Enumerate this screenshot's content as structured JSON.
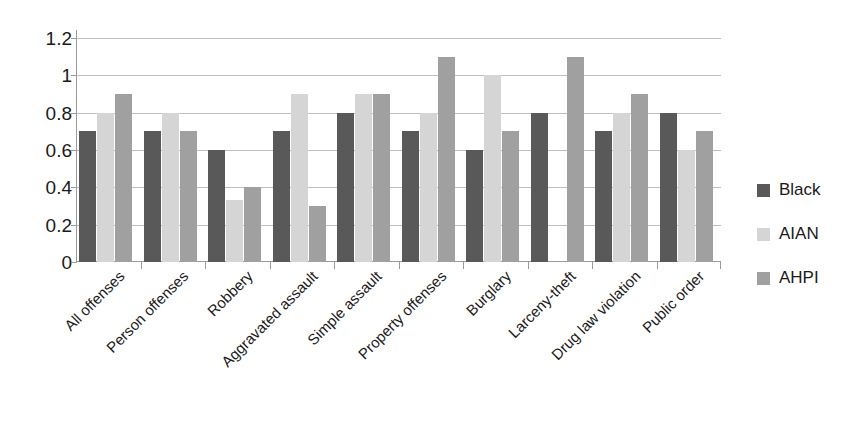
{
  "chart_data": {
    "type": "bar",
    "title": "",
    "subtitle": "",
    "xlabel": "",
    "ylabel": "",
    "ylim": [
      0,
      1.2
    ],
    "ytick_labels": [
      "1.2",
      "1",
      "0.8",
      "0.6",
      "0.4",
      "0.2",
      "0"
    ],
    "ytick_values": [
      1.2,
      1.0,
      0.8,
      0.6,
      0.4,
      0.2,
      0
    ],
    "grid": "horizontal",
    "legend_position": "right",
    "categories": [
      "All offenses",
      "Person offenses",
      "Robbery",
      "Aggravated assault",
      "Simple assault",
      "Property offenses",
      "Burglary",
      "Larceny-theft",
      "Drug law violation",
      "Public order"
    ],
    "series": [
      {
        "name": "Black",
        "color": "#595959",
        "values": [
          0.7,
          0.7,
          0.6,
          0.7,
          0.8,
          0.7,
          0.6,
          0.8,
          0.7,
          0.8
        ]
      },
      {
        "name": "AIAN",
        "color": "#d5d5d5",
        "values": [
          0.8,
          0.8,
          0.33,
          0.9,
          0.9,
          0.8,
          1.0,
          null,
          0.8,
          0.6
        ]
      },
      {
        "name": "AHPI",
        "color": "#a0a0a0",
        "values": [
          0.9,
          0.7,
          0.4,
          0.3,
          0.9,
          1.1,
          0.7,
          1.1,
          0.9,
          0.7
        ]
      }
    ]
  },
  "legend": {
    "items": [
      {
        "label": "Black",
        "color": "#595959",
        "swatch": "legend-swatch-black"
      },
      {
        "label": "AIAN",
        "color": "#d5d5d5",
        "swatch": "legend-swatch-aian"
      },
      {
        "label": "AHPI",
        "color": "#a0a0a0",
        "swatch": "legend-swatch-ahpi"
      }
    ]
  },
  "axes": {
    "y_max": 1.2,
    "y_min": 0
  }
}
